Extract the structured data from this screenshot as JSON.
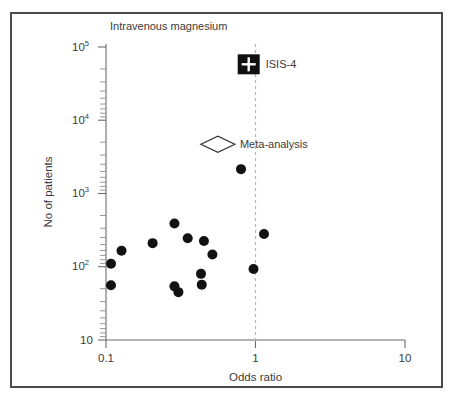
{
  "chart_data": {
    "type": "scatter",
    "title": "Intravenous magnesium",
    "xlabel": "Odds ratio",
    "ylabel": "No of patients",
    "xscale": "log",
    "yscale": "log",
    "xlim": [
      0.1,
      10
    ],
    "ylim": [
      10,
      100000
    ],
    "xticks": [
      0.1,
      1,
      10
    ],
    "xticklabels": [
      "0.1",
      "1",
      "10"
    ],
    "yticks": [
      10,
      100,
      1000,
      10000,
      100000
    ],
    "yticklabels": [
      "10",
      "10²",
      "10³",
      "10⁴",
      "10⁵"
    ],
    "grid": false,
    "reference_line": {
      "x": 1,
      "style": "dashed",
      "color": "#b4b4b4"
    },
    "series": [
      {
        "name": "Small trials",
        "marker": "filled-circle",
        "color": "#111111",
        "points": [
          {
            "x": 0.108,
            "y": 110
          },
          {
            "x": 0.108,
            "y": 56
          },
          {
            "x": 0.127,
            "y": 165
          },
          {
            "x": 0.205,
            "y": 210
          },
          {
            "x": 0.287,
            "y": 390
          },
          {
            "x": 0.287,
            "y": 54
          },
          {
            "x": 0.305,
            "y": 45
          },
          {
            "x": 0.352,
            "y": 245
          },
          {
            "x": 0.432,
            "y": 80
          },
          {
            "x": 0.437,
            "y": 57
          },
          {
            "x": 0.452,
            "y": 225
          },
          {
            "x": 0.515,
            "y": 147
          },
          {
            "x": 0.8,
            "y": 2150
          },
          {
            "x": 0.97,
            "y": 93
          },
          {
            "x": 1.14,
            "y": 280
          }
        ]
      },
      {
        "name": "Meta-analysis",
        "marker": "open-diamond",
        "color": "#ffffff",
        "points": [
          {
            "x": 0.56,
            "y": 4700
          }
        ]
      },
      {
        "name": "ISIS-4",
        "marker": "filled-square-with-plus",
        "color": "#101010",
        "points": [
          {
            "x": 0.9,
            "y": 58000
          }
        ]
      }
    ],
    "annotations": [
      {
        "text": "ISIS-4",
        "x": 1.04,
        "y": 58000
      },
      {
        "text": "Meta-analysis",
        "x": 0.66,
        "y": 4700
      },
      {
        "text": "Intravenous magnesium",
        "x": 0.135,
        "y": 150000
      }
    ]
  },
  "figure": {
    "border_color": "#4a4a4a",
    "background": "#ffffff",
    "axis_color": "#6b6b6b",
    "point_color": "#111111"
  }
}
